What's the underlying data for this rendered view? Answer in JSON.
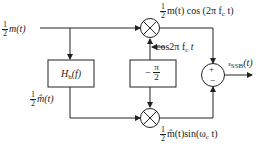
{
  "diagram": {
    "type": "SSB modulator block diagram (phase-shift method)",
    "input": {
      "coef_num": "1",
      "coef_den": "2",
      "signal": "m(t)"
    },
    "hilbert_block": {
      "label": "H",
      "sub": "h",
      "arg": "(f)"
    },
    "hilbert_output": {
      "coef_num": "1",
      "coef_den": "2",
      "signal": "m̂(t)"
    },
    "phase_shift_block": {
      "sign": "−",
      "num": "π",
      "den": "2"
    },
    "carrier_label": {
      "text": "cos2π f",
      "sub": "c",
      "tail": " t"
    },
    "top_product": {
      "coef_num": "1",
      "coef_den": "2",
      "expr": "m(t) cos (2π f",
      "sub": "c",
      "tail": " t)"
    },
    "bottom_product": {
      "coef_num": "1",
      "coef_den": "2",
      "expr": "m̂(t)sin(ω",
      "sub": "c",
      "tail": " t)"
    },
    "summer": {
      "top_sign": "+",
      "bottom_sign": "−"
    },
    "output": {
      "prefix": "s",
      "sub": "SSB",
      "arg": "(t)"
    },
    "colors": {
      "line": "#222222",
      "background": "#ffffff"
    }
  }
}
